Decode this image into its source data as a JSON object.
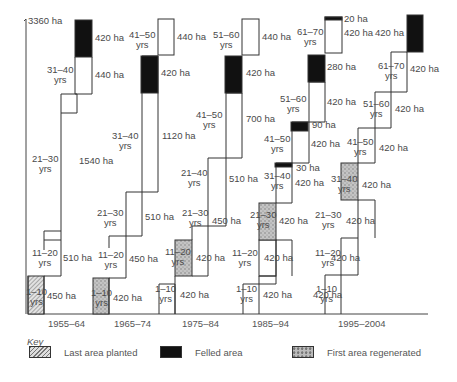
{
  "diagram": {
    "total_label": "3360 ha",
    "periods": [
      "1955–64",
      "1965–74",
      "1975–84",
      "1985–94",
      "1995–2004"
    ],
    "columns": [
      {
        "period": "1955–64",
        "blocks": [
          {
            "age": "1–10 yrs",
            "area": "450 ha",
            "fill": "planted"
          },
          {
            "age": "11–20 yrs",
            "area": "510 ha",
            "fill": "none"
          },
          {
            "age": "21–30 yrs",
            "area": "1540 ha",
            "fill": "none"
          },
          {
            "age": "31–40 yrs",
            "area": "440 ha",
            "fill": "none"
          },
          {
            "age": "",
            "area": "420 ha",
            "fill": "felled"
          }
        ]
      },
      {
        "period": "1965–74",
        "blocks": [
          {
            "age": "1–10 yrs",
            "area": "420 ha",
            "fill": "regenerated"
          },
          {
            "age": "11–20 yrs",
            "area": "450 ha",
            "fill": "none"
          },
          {
            "age": "21–30 yrs",
            "area": "510 ha",
            "fill": "none"
          },
          {
            "age": "31–40 yrs",
            "area": "1120 ha",
            "fill": "none"
          },
          {
            "age": "",
            "area": "420 ha",
            "fill": "felled"
          },
          {
            "age": "41–50 yrs",
            "area": "440 ha",
            "fill": "none"
          }
        ]
      },
      {
        "period": "1975–84",
        "blocks": [
          {
            "age": "1–10 yrs",
            "area": "420 ha",
            "fill": "none"
          },
          {
            "age": "11–20 yrs",
            "area": "420 ha",
            "fill": "regenerated"
          },
          {
            "age": "21–30 yrs",
            "area": "450 ha",
            "fill": "none"
          },
          {
            "age": "21–40 yrs",
            "area": "510 ha",
            "fill": "none"
          },
          {
            "age": "41–50 yrs",
            "area": "700 ha",
            "fill": "none"
          },
          {
            "age": "",
            "area": "420 ha",
            "fill": "felled"
          },
          {
            "age": "51–60 yrs",
            "area": "440 ha",
            "fill": "none"
          }
        ]
      },
      {
        "period": "1985–94",
        "blocks": [
          {
            "age": "1–10 yrs",
            "area": "420 ha",
            "fill": "none"
          },
          {
            "age": "11–20 yrs",
            "area": "420 ha",
            "fill": "none"
          },
          {
            "age": "21–30 yrs",
            "area": "420 ha",
            "fill": "regenerated"
          },
          {
            "age": "31–40 yrs",
            "area": "420 ha",
            "fill": "none"
          },
          {
            "age": "",
            "area": "30 ha",
            "fill": "felled"
          },
          {
            "age": "41–50 yrs",
            "area": "420 ha",
            "fill": "none"
          },
          {
            "age": "",
            "area": "90 ha",
            "fill": "felled"
          },
          {
            "age": "51–60 yrs",
            "area": "420 ha",
            "fill": "none"
          },
          {
            "age": "",
            "area": "280 ha",
            "fill": "felled"
          },
          {
            "age": "61–70 yrs",
            "area": "420 ha",
            "fill": "none"
          },
          {
            "age": "",
            "area": "20 ha",
            "fill": "felled"
          }
        ]
      },
      {
        "period": "1995–2004",
        "blocks": [
          {
            "age": "1–10 yrs",
            "area": "420 ha",
            "fill": "none"
          },
          {
            "age": "11–20 yrs",
            "area": "420 ha",
            "fill": "none"
          },
          {
            "age": "21–30 yrs",
            "area": "420 ha",
            "fill": "none"
          },
          {
            "age": "31–40 yrs",
            "area": "420 ha",
            "fill": "regenerated"
          },
          {
            "age": "41–50 yrs",
            "area": "420 ha",
            "fill": "none"
          },
          {
            "age": "51–60 yrs",
            "area": "420 ha",
            "fill": "none"
          },
          {
            "age": "61–70 yrs",
            "area": "420 ha",
            "fill": "none"
          },
          {
            "age": "",
            "area": "420 ha",
            "fill": "felled"
          }
        ]
      }
    ]
  },
  "key": {
    "title": "Key",
    "items": [
      {
        "label": "Last area planted",
        "fill": "planted"
      },
      {
        "label": "Felled area",
        "fill": "felled"
      },
      {
        "label": "First area regenerated",
        "fill": "regenerated"
      }
    ]
  },
  "labels": {
    "c0_age": [
      "1–10",
      "11–20",
      "21–30",
      "31–40"
    ],
    "c0_area": [
      "450 ha",
      "510 ha",
      "1540 ha",
      "440 ha",
      "420 ha"
    ],
    "c1_age": [
      "1–10",
      "11–20",
      "21–30",
      "31–40",
      "41–50"
    ],
    "c1_area": [
      "420 ha",
      "450 ha",
      "510 ha",
      "1120 ha",
      "420 ha",
      "440 ha"
    ],
    "c2_age": [
      "1–10",
      "11–20",
      "21–30",
      "21–40",
      "41–50",
      "51–60"
    ],
    "c2_area": [
      "420 ha",
      "420 ha",
      "450 ha",
      "510 ha",
      "700 ha",
      "420 ha",
      "440 ha"
    ],
    "c3_age": [
      "1–10",
      "11–20",
      "21–30",
      "31–40",
      "41–50",
      "51–60",
      "61–70"
    ],
    "c3_area": [
      "420 ha",
      "420 ha",
      "420 ha",
      "420 ha",
      "30 ha",
      "420 ha",
      "90 ha",
      "420 ha",
      "280 ha",
      "420 ha",
      "20 ha"
    ],
    "c4_age": [
      "1–10",
      "11–20",
      "21–30",
      "31–40",
      "41–50",
      "51–60",
      "61–70"
    ],
    "c4_area": [
      "420 ha",
      "420 ha",
      "420 ha",
      "420 ha",
      "420 ha",
      "420 ha",
      "420 ha",
      "420 ha"
    ],
    "yrs": "yrs"
  }
}
